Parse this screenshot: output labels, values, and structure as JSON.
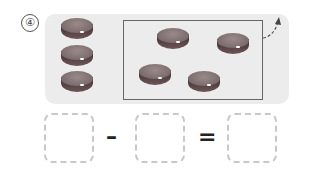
{
  "problem": {
    "number_label": "④",
    "left_pieces": 3,
    "box_pieces": 4,
    "operators": {
      "minus": "–",
      "equals": "="
    },
    "answer_boxes": [
      "",
      "",
      ""
    ],
    "colors": {
      "panel": "#ececec",
      "box_border": "#666666",
      "dashed_border": "#c8c8c8",
      "piece": "#6e5f60"
    }
  }
}
